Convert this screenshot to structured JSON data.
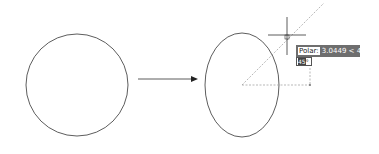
{
  "figure": {
    "stroke_color": "#333333",
    "tracking_color": "#9a9a9a"
  },
  "left_shape": {
    "type": "circle",
    "cx": 77,
    "cy": 85,
    "r": 51
  },
  "arrow": {
    "x1": 138,
    "y1": 79,
    "x2": 198,
    "y2": 79
  },
  "right_shape": {
    "type": "ellipse",
    "cx": 242,
    "cy": 85,
    "rx": 37,
    "ry": 52
  },
  "cursor": {
    "x": 288,
    "y": 37
  },
  "tooltip": {
    "label": "Polar:",
    "value": "3.0449 < 45°"
  },
  "input": {
    "value": "45",
    "suffix": "°"
  }
}
